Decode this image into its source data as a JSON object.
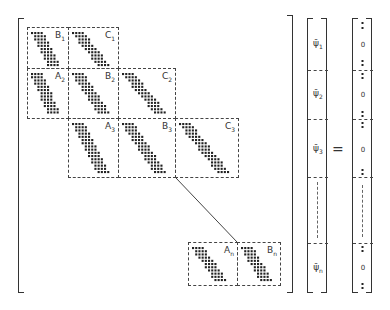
{
  "diagram": {
    "type": "block-tridiagonal-matrix-equation",
    "matrix_blocks": [
      {
        "row": 1,
        "label": "B",
        "sub": "1"
      },
      {
        "row": 1,
        "label": "C",
        "sub": "1"
      },
      {
        "row": 2,
        "label": "A",
        "sub": "2"
      },
      {
        "row": 2,
        "label": "B",
        "sub": "2"
      },
      {
        "row": 2,
        "label": "C",
        "sub": "2"
      },
      {
        "row": 3,
        "label": "A",
        "sub": "3"
      },
      {
        "row": 3,
        "label": "B",
        "sub": "3"
      },
      {
        "row": 3,
        "label": "C",
        "sub": "3"
      },
      {
        "row": "n",
        "label": "A",
        "sub": "n"
      },
      {
        "row": "n",
        "label": "B",
        "sub": "n"
      }
    ],
    "unknown_vector": [
      {
        "label": "ψ̄",
        "sub": "1"
      },
      {
        "label": "ψ̄",
        "sub": "2"
      },
      {
        "label": "ψ̄",
        "sub": "3"
      },
      {
        "label": "",
        "sub": ""
      },
      {
        "label": "ψ̄",
        "sub": "n"
      }
    ],
    "equals": "=",
    "rhs_vector": [
      "0",
      "0",
      "0",
      "",
      "0"
    ]
  }
}
